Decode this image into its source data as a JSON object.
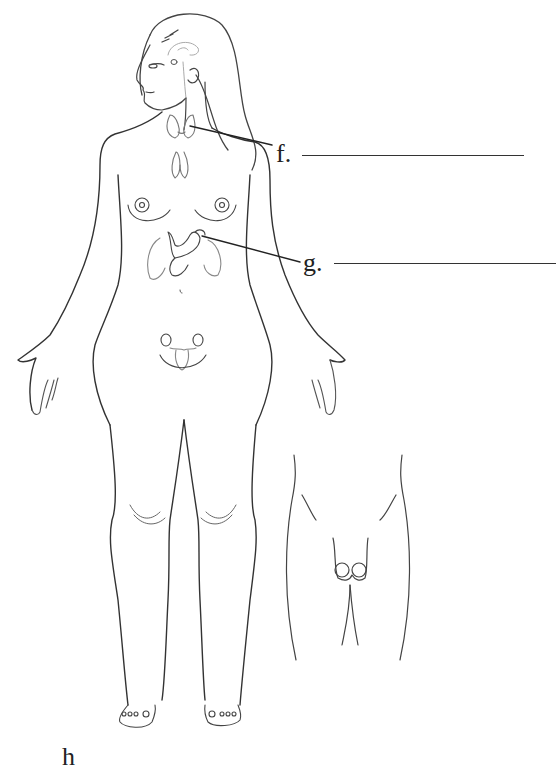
{
  "diagram": {
    "type": "endocrine-system-labeling-worksheet",
    "subjects": [
      "female-body-front",
      "male-pelvis-inset"
    ],
    "colors": {
      "outline": "#333333",
      "organ": "#888888",
      "background": "#ffffff"
    }
  },
  "labels": [
    {
      "id": "f",
      "text": "f.",
      "points_to": "thyroid-gland",
      "answer_blank": ""
    },
    {
      "id": "g",
      "text": "g.",
      "points_to": "pancreas",
      "answer_blank": ""
    },
    {
      "id": "h",
      "text": "h",
      "points_to": "",
      "answer_blank": ""
    }
  ]
}
